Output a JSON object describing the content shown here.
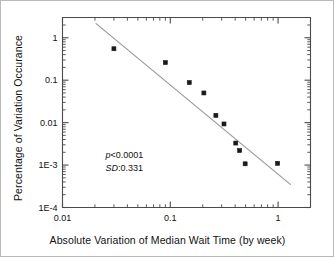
{
  "chart_data": {
    "type": "scatter",
    "title": "",
    "xlabel": "Absolute Variation of Median Wait Time (by week)",
    "ylabel": "Percentage of Variation Occurance",
    "xscale": "log",
    "yscale": "log",
    "xlim": [
      0.01,
      2.0
    ],
    "ylim": [
      0.0001,
      3.0
    ],
    "grid": false,
    "legend": null,
    "xticks": [
      {
        "value": 0.01,
        "label": "0.01"
      },
      {
        "value": 0.1,
        "label": "0.1"
      },
      {
        "value": 1,
        "label": "1"
      }
    ],
    "yticks": [
      {
        "value": 1,
        "label": "1"
      },
      {
        "value": 0.1,
        "label": "0.1"
      },
      {
        "value": 0.01,
        "label": "0.01"
      },
      {
        "value": 0.001,
        "label": "1E-3"
      },
      {
        "value": 0.0001,
        "label": "1E-4"
      }
    ],
    "marker": "square",
    "marker_color": "#1a1a1a",
    "marker_size": 4,
    "points": [
      {
        "x": 0.03,
        "y": 0.55
      },
      {
        "x": 0.09,
        "y": 0.26
      },
      {
        "x": 0.15,
        "y": 0.088
      },
      {
        "x": 0.205,
        "y": 0.05
      },
      {
        "x": 0.265,
        "y": 0.0148
      },
      {
        "x": 0.315,
        "y": 0.0093
      },
      {
        "x": 0.405,
        "y": 0.0033
      },
      {
        "x": 0.44,
        "y": 0.0022
      },
      {
        "x": 0.495,
        "y": 0.00107
      },
      {
        "x": 0.99,
        "y": 0.0011
      }
    ],
    "trendline": {
      "color": "#9a9a9a",
      "width": 1.2,
      "x_start": 0.0205,
      "y_start": 2.15,
      "x_end": 1.3,
      "y_end": 0.00035
    },
    "annotations": [
      {
        "id": "p-value",
        "symbol": "p",
        "text": "<0.0001",
        "x": 0.025,
        "y": 0.0016
      },
      {
        "id": "sd-value",
        "symbol": "SD",
        "text": ":0.331",
        "x": 0.025,
        "y": 0.00082
      }
    ]
  },
  "axes": {
    "x_title": "Absolute Variation of Median Wait Time (by week)",
    "y_title": "Percentage of Variation Occurance"
  },
  "colors": {
    "marker": "#1a1a1a",
    "trendline": "#9a9a9a",
    "axis": "#4a4a4a",
    "frame_border": "#b9b9b9",
    "text": "#111111",
    "background": "#ffffff"
  }
}
